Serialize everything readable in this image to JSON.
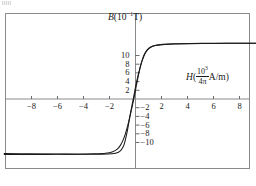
{
  "figure": {
    "background_color": "#ffffff",
    "frame_color": "#8a8a8a",
    "curve_color": "#1a1a1a",
    "axis_color": "#8a8a8a",
    "text_color": "#1a1a1a",
    "artifact_name": "scan-artifact"
  },
  "axis_titles": {
    "y": {
      "symbol": "B",
      "open_paren": "(",
      "base": "10",
      "exponent": "−1",
      "unit": "T",
      "close_paren": ")",
      "full_text": "B(10−1T)"
    },
    "x": {
      "symbol": "H",
      "open_paren": "(",
      "numerator_base": "10",
      "numerator_exponent": "3",
      "denominator": "4π",
      "unit": "A/m",
      "close_paren": ")",
      "full_text": "H(10³/4π A/m)"
    }
  },
  "ticks": {
    "x_labels": [
      "−8",
      "−6",
      "−4",
      "−2",
      "2",
      "4",
      "6",
      "8"
    ],
    "y_labels": [
      "10",
      "8",
      "6",
      "4",
      "2",
      "−2",
      "−4",
      "−6",
      "−8",
      "−10"
    ]
  },
  "chart_data": {
    "type": "line",
    "title": "",
    "subtitle": "",
    "xlabel": "H(10³/4π A/m)",
    "ylabel": "B(10⁻¹T)",
    "xlim": [
      -10.1,
      9.4
    ],
    "ylim": [
      -13.3,
      13.3
    ],
    "grid": false,
    "legend": null,
    "xticks": [
      -8,
      -6,
      -4,
      -2,
      2,
      4,
      6,
      8
    ],
    "yticks": [
      10,
      8,
      6,
      4,
      2,
      -2,
      -4,
      -6,
      -8,
      -10
    ],
    "annotations": [],
    "series": [
      {
        "name": "ascending-branch",
        "comment": "H increasing: from negative saturation up through positive coercivity to positive saturation",
        "x": [
          -10.1,
          -8.0,
          -6.0,
          -4.0,
          -2.6,
          -1.8,
          -1.35,
          -1.1,
          -0.95,
          -0.85,
          -0.75,
          -0.62,
          -0.5,
          -0.38,
          -0.26,
          -0.14,
          -0.04,
          0.06,
          0.18,
          0.3,
          0.42,
          0.55,
          0.7,
          0.9,
          1.15,
          1.5,
          2.1,
          3.0,
          4.2,
          5.6,
          7.0,
          8.2,
          9.4
        ],
        "y": [
          -12.55,
          -12.6,
          -12.65,
          -12.7,
          -12.72,
          -12.6,
          -12.3,
          -11.7,
          -11.0,
          -10.2,
          -9.0,
          -7.2,
          -5.2,
          -3.2,
          -1.3,
          0.5,
          2.1,
          3.6,
          5.2,
          6.6,
          7.9,
          9.1,
          10.2,
          11.2,
          11.9,
          12.3,
          12.6,
          12.72,
          12.78,
          12.8,
          12.82,
          12.83,
          12.84
        ]
      },
      {
        "name": "descending-branch",
        "comment": "H decreasing: from positive saturation down through negative coercivity to negative saturation",
        "x": [
          9.4,
          8.2,
          7.0,
          5.6,
          4.2,
          3.0,
          2.1,
          1.5,
          1.15,
          0.9,
          0.7,
          0.55,
          0.42,
          0.3,
          0.18,
          0.06,
          -0.04,
          -0.16,
          -0.3,
          -0.45,
          -0.6,
          -0.78,
          -0.95,
          -1.15,
          -1.4,
          -1.75,
          -2.3,
          -3.2,
          -4.6,
          -6.2,
          -7.8,
          -9.2,
          -10.1
        ],
        "y": [
          12.84,
          12.82,
          12.8,
          12.76,
          12.7,
          12.62,
          12.5,
          12.3,
          11.9,
          11.3,
          10.4,
          9.3,
          8.0,
          6.5,
          4.8,
          3.0,
          1.4,
          -0.4,
          -2.3,
          -4.3,
          -6.1,
          -8.0,
          -9.4,
          -10.6,
          -11.5,
          -12.1,
          -12.45,
          -12.6,
          -12.68,
          -12.72,
          -12.74,
          -12.75,
          -12.76
        ]
      }
    ]
  }
}
